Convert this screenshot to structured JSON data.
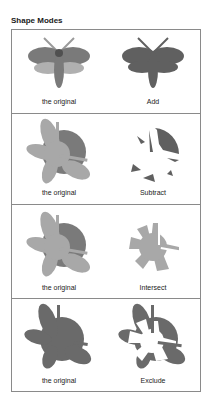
{
  "title": "Shape Modes",
  "colors": {
    "frame": "#8a8a8a",
    "dark": "#606060",
    "mid": "#7a7a7a",
    "light": "#a8a8a8",
    "lighter": "#b8b8b8"
  },
  "panels": [
    {
      "left_label": "the original",
      "right_label": "Add"
    },
    {
      "left_label": "the original",
      "right_label": "Subtract"
    },
    {
      "left_label": "the original",
      "right_label": "Intersect"
    },
    {
      "left_label": "the original",
      "right_label": "Exclude"
    }
  ]
}
